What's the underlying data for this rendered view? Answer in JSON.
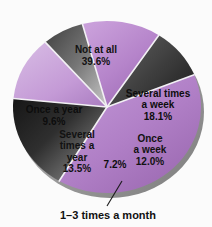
{
  "chart_data": {
    "type": "pie",
    "title": "",
    "subtitle": "",
    "xlabel": "",
    "ylabel": "",
    "legend_position": "none",
    "grid": false,
    "units": "percent",
    "categories": [
      "Not at all",
      "Several times a week",
      "Once a week",
      "1–3 times a month",
      "Several times a year",
      "Once a year"
    ],
    "values": [
      39.6,
      18.1,
      12.0,
      7.2,
      13.5,
      9.6
    ],
    "slices": [
      {
        "id": "not-at-all",
        "label": "Not at all",
        "label_lines": [
          "Not at all",
          "39.6%"
        ],
        "value": 39.6,
        "value_text": "39.6%",
        "color": "#b07fc6",
        "color_dark": "#9c6bb4",
        "tone": "purple",
        "label_inside": true,
        "label_x": 96,
        "label_y": 56
      },
      {
        "id": "several-times-a-week",
        "label": "Several times a week",
        "label_lines": [
          "Several times",
          "a week",
          "18.1%"
        ],
        "value": 18.1,
        "value_text": "18.1%",
        "color": "#3a3a3a",
        "color_dark": "#1d1d1d",
        "tone": "dark",
        "label_inside": true,
        "label_x": 158,
        "label_y": 105
      },
      {
        "id": "once-a-week",
        "label": "Once a week",
        "label_lines": [
          "Once",
          "a week",
          "12.0%"
        ],
        "value": 12.0,
        "value_text": "12.0%",
        "color": "#c49ad6",
        "color_dark": "#ae81c4",
        "tone": "purple",
        "label_inside": true,
        "label_x": 150,
        "label_y": 150
      },
      {
        "id": "one-to-three-times-a-month",
        "label": "1–3 times a month",
        "label_lines": [
          "7.2%"
        ],
        "value": 7.2,
        "value_text": "7.2%",
        "color": "#6b6b6b",
        "color_dark": "#3b3b3b",
        "tone": "dark",
        "label_inside": true,
        "label_x": 115,
        "label_y": 165,
        "callout": true,
        "callout_text": "1–3 times a month",
        "callout_x": 108,
        "callout_y": 219,
        "leader_from_x": 122,
        "leader_from_y": 181,
        "leader_to_x": 107,
        "leader_to_y": 206
      },
      {
        "id": "several-times-a-year",
        "label": "Several times a year",
        "label_lines": [
          "Several",
          "times a",
          "year",
          "13.5%"
        ],
        "value": 13.5,
        "value_text": "13.5%",
        "color": "#b584ca",
        "color_dark": "#9d6ab4",
        "tone": "purple",
        "label_inside": true,
        "label_x": 77,
        "label_y": 152
      },
      {
        "id": "once-a-year",
        "label": "Once a year",
        "label_lines": [
          "Once a year",
          "9.6%"
        ],
        "value": 9.6,
        "value_text": "9.6%",
        "color": "#4e4e4e",
        "color_dark": "#2b2b2b",
        "tone": "dark",
        "label_inside": true,
        "label_x": 54,
        "label_y": 116
      }
    ],
    "geometry": {
      "center_x": 107,
      "center_y": 107,
      "radius_x": 94,
      "radius_y": 86,
      "start_angle_deg": -22,
      "direction": "clockwise",
      "rim_color": "#8f8f8f",
      "background": "#fbfbfb"
    }
  }
}
